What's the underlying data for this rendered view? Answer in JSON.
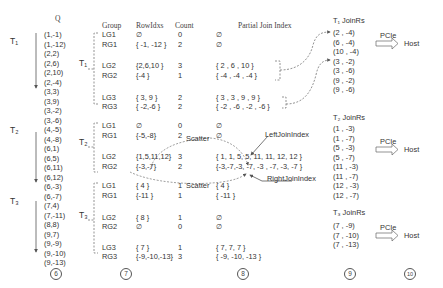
{
  "headers": {
    "q": "Q",
    "group": "Group",
    "rowidxs": "RowIdxs",
    "count": "Count",
    "partial_join_index": "Partial Join Index",
    "t1_joinrs": "T₁ JoinRs",
    "t2_joinrs": "T₂ JoinRs",
    "t3_joinrs": "T₃ JoinRs"
  },
  "threads": {
    "t1": "T₁",
    "t2": "T₂",
    "t3": "T₃"
  },
  "q_tuples": [
    "(1,-1)",
    "(1,-12)",
    "(2,2)",
    "(2,6)",
    "(2,10)",
    "(2,-4)",
    "(3,3)",
    "(3,9)",
    "(3,-2)",
    "(3,-6)",
    "(4,-5)",
    "(4,-8)",
    "(6,1)",
    "(6,5)",
    "(6,11)",
    "(6,12)",
    "(6,-3)",
    "(6,-7)",
    "(7,4)",
    "(7,-11)",
    "(8,8)",
    "(9,7)",
    "(9,-9)",
    "(9,-10)",
    "(9,-13)"
  ],
  "groups": [
    {
      "thread": "T1",
      "rows": [
        {
          "group": "LG1",
          "rowidxs": "∅",
          "count": "0",
          "pji": "∅"
        },
        {
          "group": "RG1",
          "rowidxs": "{ -1, -12 }",
          "count": "2",
          "pji": "∅"
        },
        {
          "group": "LG2",
          "rowidxs": "{2,6,10 }",
          "count": "3",
          "pji": "{  2 ,  6 , 10 }"
        },
        {
          "group": "RG2",
          "rowidxs": "{-4 }",
          "count": "1",
          "pji": "{ -4 , -4 , -4 }"
        },
        {
          "group": "LG3",
          "rowidxs": "{ 3, 9 }",
          "count": "2",
          "pji": "{  3 ,  3 ,  9 ,  9 }"
        },
        {
          "group": "RG3",
          "rowidxs": "{ -2,-6 }",
          "count": "2",
          "pji": "{ -2 , -6 , -2 , -6 }"
        }
      ]
    },
    {
      "thread": "T2",
      "rows": [
        {
          "group": "LG1",
          "rowidxs": "∅",
          "count": "0",
          "pji": "∅"
        },
        {
          "group": "RG1",
          "rowidxs": "{-5,-8}",
          "count": "2",
          "pji": "∅"
        },
        {
          "group": "LG2",
          "rowidxs": "{1,5,11,12}",
          "count": "3",
          "pji": "{ 1, 1,  5,  5, 11, 11, 12, 12 }"
        },
        {
          "group": "RG2",
          "rowidxs": "{-3,-7}",
          "count": "2",
          "pji": "{-3,-7,-3, -7, -3 , -7,  -3, -7 }"
        }
      ]
    },
    {
      "thread": "T3",
      "rows": [
        {
          "group": "LG1",
          "rowidxs": "{ 4 }",
          "count": "1",
          "pji": "{  4  }"
        },
        {
          "group": "RG1",
          "rowidxs": "{-11 }",
          "count": "1",
          "pji": "{ -11  }"
        },
        {
          "group": "LG2",
          "rowidxs": "{ 8 }",
          "count": "1",
          "pji": "∅"
        },
        {
          "group": "RG2",
          "rowidxs": "∅",
          "count": "0",
          "pji": "∅"
        },
        {
          "group": "LG3",
          "rowidxs": "{ 7 }",
          "count": "1",
          "pji": "{  7,     7,   7 }"
        },
        {
          "group": "RG3",
          "rowidxs": "{-9,-10,-13}",
          "count": "3",
          "pji": "{ -9,  -10, -13 }"
        }
      ]
    }
  ],
  "annotations": {
    "scatter_1": "Scatter",
    "scatter_2": "Scatter",
    "left_join_index": "LeftJoinIndex",
    "right_join_index": "RightJoinIndex"
  },
  "joinrs": {
    "t1": [
      "(2  ,  -4)",
      "(6  ,  -4)",
      "(10 , -4)",
      "(3  ,  -2)",
      "(3  ,  -6)",
      "(9  ,  -2)",
      "(9  ,  -6)"
    ],
    "t2": [
      "(1  ,  -3)",
      "(1  ,  -7)",
      "(5  ,  -3)",
      "(5  ,  -7)",
      "(11 , -3)",
      "(11 , -7)",
      "(12 , -3)",
      "(12 , -7)"
    ],
    "t3": [
      "(7  ,  -9)",
      "(7  , -10)",
      "(7  , -13)"
    ]
  },
  "transfer": {
    "label": "PCIe",
    "target": "Host"
  },
  "step_labels": [
    "6",
    "7",
    "8",
    "9",
    "10"
  ]
}
